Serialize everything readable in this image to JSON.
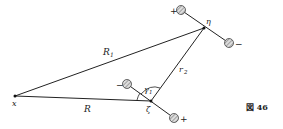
{
  "figure": {
    "caption": "図 46",
    "points": {
      "x": {
        "label": "x",
        "pos": [
          15,
          96
        ]
      },
      "eta": {
        "label": "η",
        "pos": [
          204,
          28
        ]
      },
      "zeta": {
        "label": "ζ",
        "pos": [
          151,
          101
        ]
      }
    },
    "segments": {
      "R1": {
        "label": "R",
        "sub": "1"
      },
      "R": {
        "label": "R"
      },
      "r2": {
        "label": "r",
        "sub": "2"
      }
    },
    "angle": {
      "label": "γ",
      "sub": "1"
    },
    "dipole_eta": {
      "plus": "+",
      "minus": "−"
    },
    "dipole_zeta": {
      "plus": "+",
      "minus": "−"
    }
  }
}
